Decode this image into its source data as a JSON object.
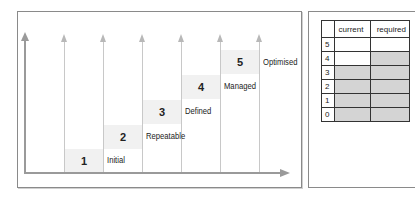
{
  "diagram": {
    "steps": [
      {
        "number": "1",
        "label": "Initial"
      },
      {
        "number": "2",
        "label": "Repeatable"
      },
      {
        "number": "3",
        "label": "Defined"
      },
      {
        "number": "4",
        "label": "Managed"
      },
      {
        "number": "5",
        "label": "Optimised"
      }
    ],
    "colors": {
      "step_fill": "#f1f1f1",
      "axis": "#9a9a9a",
      "guide_line": "#c8c8c8",
      "table_shade": "#d4d4d4",
      "table_grid": "#333333"
    }
  },
  "table": {
    "headers": [
      "",
      "current",
      "required"
    ],
    "rows": [
      {
        "level": "5",
        "current": false,
        "required": false
      },
      {
        "level": "4",
        "current": false,
        "required": true
      },
      {
        "level": "3",
        "current": true,
        "required": true
      },
      {
        "level": "2",
        "current": true,
        "required": true
      },
      {
        "level": "1",
        "current": true,
        "required": true
      },
      {
        "level": "0",
        "current": true,
        "required": true
      }
    ]
  }
}
